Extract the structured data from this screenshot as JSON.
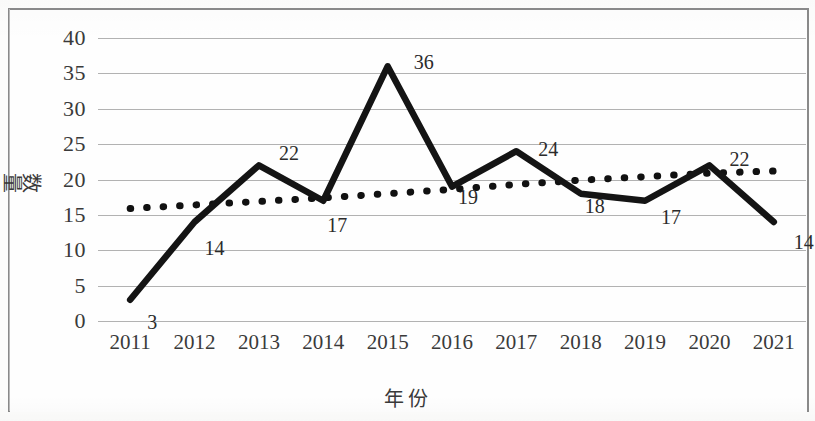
{
  "chart_data": {
    "type": "line",
    "title": "",
    "xlabel": "年份",
    "ylabel": "数量",
    "categories": [
      "2011",
      "2012",
      "2013",
      "2014",
      "2015",
      "2016",
      "2017",
      "2018",
      "2019",
      "2020",
      "2021"
    ],
    "ylim": [
      0,
      40
    ],
    "ytick_step": 5,
    "yticks": [
      "40",
      "35",
      "30",
      "25",
      "20",
      "15",
      "10",
      "5",
      "0"
    ],
    "grid": "horizontal",
    "legend": "none",
    "series": [
      {
        "name": "数量",
        "style": "solid-thick-black",
        "color": "#111111",
        "values": [
          3,
          14,
          22,
          17,
          36,
          19,
          24,
          18,
          17,
          22,
          14
        ],
        "data_labels": [
          "3",
          "14",
          "22",
          "17",
          "36",
          "19",
          "24",
          "18",
          "17",
          "22",
          "14"
        ]
      },
      {
        "name": "趋势线",
        "style": "dotted-black",
        "color": "#111111",
        "values": [
          15.9,
          16.4,
          16.9,
          17.4,
          18.0,
          18.6,
          19.3,
          19.9,
          20.4,
          20.9,
          21.2
        ]
      }
    ]
  },
  "labels": {
    "y_axis_title": "数量",
    "x_axis_title": "年份"
  }
}
